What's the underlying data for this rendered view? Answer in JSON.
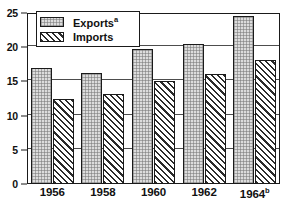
{
  "chart_data": {
    "type": "bar",
    "title": "",
    "subtitle": "",
    "xlabel": "",
    "ylabel": "",
    "categories": [
      "1956",
      "1958",
      "1960",
      "1962",
      "1964"
    ],
    "category_labels": [
      {
        "text": "1956",
        "superscript": ""
      },
      {
        "text": "1958",
        "superscript": ""
      },
      {
        "text": "1960",
        "superscript": ""
      },
      {
        "text": "1962",
        "superscript": ""
      },
      {
        "text": "1964",
        "superscript": "b"
      }
    ],
    "series": [
      {
        "name": "Exports",
        "superscript": "a",
        "fill": "stipple",
        "color": "#dcdcdc",
        "values": [
          17.0,
          16.2,
          19.8,
          20.5,
          24.5
        ]
      },
      {
        "name": "Imports",
        "superscript": "",
        "fill": "diagonal-hatch",
        "color": "#2b2b2b",
        "values": [
          12.5,
          13.2,
          15.0,
          16.1,
          18.2
        ]
      }
    ],
    "ylim": [
      0,
      25
    ],
    "yticks": [
      0,
      5,
      10,
      15,
      20,
      25
    ],
    "ytick_labels": [
      "0",
      "5",
      "10",
      "15",
      "20",
      "25"
    ],
    "grid": true,
    "grid_axis": "y",
    "legend_position": "inside-top-left",
    "frame": true,
    "axis_color": "#1a1a1a",
    "grid_color": "#4d4d4d"
  },
  "legend": {
    "entries": [
      {
        "label": "Exports",
        "superscript": "a"
      },
      {
        "label": "Imports",
        "superscript": ""
      }
    ]
  }
}
